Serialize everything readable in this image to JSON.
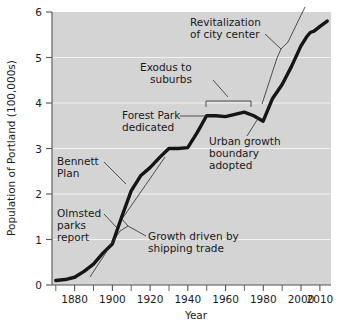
{
  "chart_data": {
    "type": "line",
    "title": "",
    "xlabel": "Year",
    "ylabel": "Population of Portland (100,000s)",
    "xlim": [
      1868,
      2016
    ],
    "ylim": [
      0,
      6
    ],
    "grid": true,
    "legend": "none",
    "x_ticks_major": [
      1880,
      1900,
      1920,
      1940,
      1960,
      1980,
      2000,
      2010
    ],
    "x_tick_labels": [
      "1880",
      "1900",
      "1920",
      "1940",
      "1960",
      "1980",
      "2000",
      "2010"
    ],
    "x_ticks_minor": [
      1870,
      1890,
      1910,
      1930,
      1950,
      1970,
      1990,
      2010
    ],
    "y_ticks": [
      0,
      1,
      2,
      3,
      4,
      5,
      6
    ],
    "y_tick_labels": [
      "0",
      "1",
      "2",
      "3",
      "4",
      "5",
      "6"
    ],
    "series": [
      {
        "name": "Population of Portland",
        "units": "100,000s",
        "x": [
          1870,
          1875,
          1880,
          1885,
          1890,
          1895,
          1900,
          1905,
          1910,
          1915,
          1920,
          1925,
          1930,
          1935,
          1940,
          1945,
          1950,
          1955,
          1960,
          1965,
          1970,
          1975,
          1980,
          1985,
          1990,
          1995,
          2000,
          2003,
          2005,
          2007,
          2010,
          2014
        ],
        "values": [
          0.1,
          0.12,
          0.17,
          0.3,
          0.46,
          0.7,
          0.9,
          1.5,
          2.07,
          2.4,
          2.58,
          2.8,
          3.0,
          3.0,
          3.02,
          3.35,
          3.72,
          3.72,
          3.7,
          3.75,
          3.8,
          3.72,
          3.6,
          4.1,
          4.4,
          4.8,
          5.25,
          5.45,
          5.55,
          5.58,
          5.68,
          5.8
        ]
      }
    ],
    "annotations": [
      {
        "id": "revitalization",
        "lines": [
          "Revitalization",
          "of city center"
        ],
        "points_to_year": 1992,
        "points_to_value": 5.0
      },
      {
        "id": "exodus",
        "lines": [
          "Exodus to",
          "suburbs"
        ],
        "bracket_years": [
          1950,
          1980
        ],
        "bracket_value": 4.0
      },
      {
        "id": "forest-park",
        "lines": [
          "Forest Park",
          "dedicated"
        ],
        "points_to_year": 1948,
        "points_to_value": 3.72
      },
      {
        "id": "urban-growth",
        "lines": [
          "Urban growth",
          "boundary",
          "adopted"
        ],
        "points_to_year": 1980,
        "points_to_value": 3.6
      },
      {
        "id": "bennett-plan",
        "lines": [
          "Bennett",
          "Plan"
        ],
        "points_to_year": 1912,
        "points_to_value": 2.2
      },
      {
        "id": "olmsted",
        "lines": [
          "Olmsted",
          "parks",
          "report"
        ],
        "points_to_year": 1903,
        "points_to_value": 1.2
      },
      {
        "id": "shipping-trade",
        "lines": [
          "Growth driven by",
          "shipping trade"
        ],
        "bracket_years": [
          1890,
          1938
        ],
        "bracket_note": "long vertical bracket along rising curve"
      }
    ]
  },
  "axes": {
    "y_title": "Population of Portland (100,000s)",
    "x_title": "Year",
    "y_labels": [
      "6",
      "5",
      "4",
      "3",
      "2",
      "1",
      "0"
    ],
    "x_labels": [
      "1880",
      "1900",
      "1920",
      "1940",
      "1960",
      "1980",
      "2000",
      "2010"
    ]
  },
  "annotations_text": {
    "revitalization_l1": "Revitalization",
    "revitalization_l2": "of city center",
    "exodus_l1": "Exodus to",
    "exodus_l2": "suburbs",
    "forest_park_l1": "Forest Park",
    "forest_park_l2": "dedicated",
    "urban_growth_l1": "Urban growth",
    "urban_growth_l2": "boundary",
    "urban_growth_l3": "adopted",
    "bennett_l1": "Bennett",
    "bennett_l2": "Plan",
    "olmsted_l1": "Olmsted",
    "olmsted_l2": "parks",
    "olmsted_l3": "report",
    "shipping_l1": "Growth driven by",
    "shipping_l2": "shipping trade"
  },
  "colors": {
    "plot_background": "#d4d4d4",
    "page_background": "#ffffff",
    "data_line": "#151515",
    "gridline": "#f2f2f2",
    "axis": "#555555",
    "text": "#1b1b1b"
  }
}
